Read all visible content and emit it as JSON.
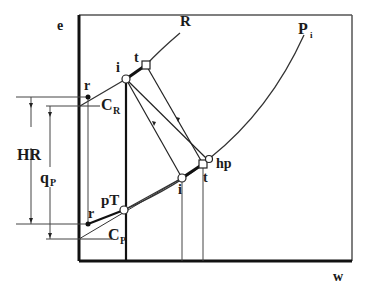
{
  "diagram": {
    "axes": {
      "y_label": "e",
      "x_label": "w"
    },
    "curves": {
      "R_label": "R",
      "Pi_label": "P",
      "Pi_subscript": "i"
    },
    "points": {
      "upper_i": "i",
      "upper_t": "t",
      "upper_r": "r",
      "lower_r": "r",
      "lower_i": "i",
      "lower_t": "t",
      "hp": "hp",
      "pT": "pT"
    },
    "slopes": {
      "CR_main": "C",
      "CR_sub": "R",
      "CP_main": "C",
      "CP_sub": "P"
    },
    "dimensions": {
      "HR": "HR",
      "qP_main": "q",
      "qP_sub": "P"
    }
  }
}
